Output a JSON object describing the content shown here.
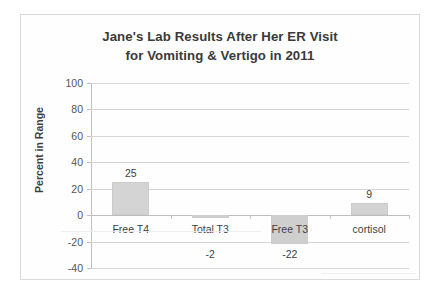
{
  "chart_data": {
    "type": "bar",
    "title": "Jane's Lab Results After Her ER Visit for Vomiting & Vertigo in 2011",
    "title_line1": "Jane's Lab Results After Her ER Visit",
    "title_line2": "for Vomiting & Vertigo in 2011",
    "categories": [
      "Free T4",
      "Total T3",
      "Free T3",
      "cortisol"
    ],
    "values": [
      25,
      -2,
      -22,
      9
    ],
    "data_labels": [
      "25",
      "-2",
      "-22",
      "9"
    ],
    "xlabel": "",
    "ylabel": "Percent in Range",
    "ylim": [
      -40,
      100
    ],
    "ytick_step": 20,
    "ytick_labels": [
      "100",
      "80",
      "60",
      "40",
      "20",
      "0",
      "-20",
      "-40"
    ],
    "ytick_values": [
      100,
      80,
      60,
      40,
      20,
      0,
      -20,
      -40
    ],
    "grid": true,
    "legend": false,
    "bar_color": "#d4d4d4",
    "gridline_color": "#d6d6d6",
    "axis_color": "#bfbfbf",
    "text_color": "#404040",
    "background": "#fefefe"
  }
}
